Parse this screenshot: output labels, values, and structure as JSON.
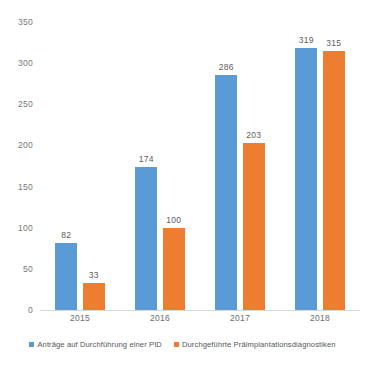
{
  "chart_data": {
    "type": "bar",
    "title": "",
    "subtitle": "",
    "xlabel": "",
    "ylabel": "",
    "categories": [
      "2015",
      "2016",
      "2017",
      "2018"
    ],
    "series": [
      {
        "name": "Anträge auf Durchführung einer PID",
        "color": "#5B9BD5",
        "values": [
          82,
          174,
          286,
          319
        ]
      },
      {
        "name": "Durchgeführte Präimplantationsdiagnostiken",
        "color": "#ED7D31",
        "values": [
          33,
          100,
          203,
          315
        ]
      }
    ],
    "ylim": [
      0,
      350
    ],
    "yticks": [
      0,
      50,
      100,
      150,
      200,
      250,
      300,
      350
    ],
    "ytick_labels": [
      "0",
      "50",
      "100",
      "150",
      "200",
      "250",
      "300",
      "350"
    ],
    "grid": false,
    "data_labels": true,
    "legend_position": "bottom"
  },
  "legend": {
    "items": [
      {
        "label": "Anträge auf Durchführung einer PID",
        "swatch": "#5B9BD5"
      },
      {
        "label": "Durchgeführte Präimplantationsdiagnostiken",
        "swatch": "#ED7D31"
      }
    ]
  }
}
